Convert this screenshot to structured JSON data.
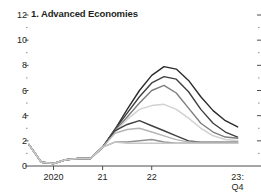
{
  "chart_data": {
    "type": "line",
    "title": "1. Advanced Economies",
    "xlabel": "",
    "ylabel": "",
    "ylim": [
      0,
      12
    ],
    "yticks": [
      0,
      2,
      4,
      6,
      8,
      10,
      12
    ],
    "ytick_labels": [
      "0",
      "2",
      "4",
      "6",
      "8",
      "10",
      "12"
    ],
    "minor_yticks": [
      1,
      3,
      5,
      7,
      9,
      11
    ],
    "grid": false,
    "legend": "none",
    "xtick_labels": [
      "2020",
      "21",
      "22",
      "23:\nQ4"
    ],
    "xticks": [
      2020.0,
      2021.0,
      2022.0,
      2023.75
    ],
    "xlim": [
      2019.5,
      2023.9
    ],
    "x": [
      2019.5,
      2019.75,
      2020.0,
      2020.25,
      2020.5,
      2020.75,
      2021.0,
      2021.25,
      2021.5,
      2021.75,
      2022.0,
      2022.25,
      2022.5,
      2022.75,
      2023.0,
      2023.25,
      2023.5,
      2023.75
    ],
    "series": [
      {
        "name": "series-1-darkest",
        "color": "#2b2b2b",
        "width": 1.4,
        "values": [
          1.7,
          0.3,
          0.2,
          0.5,
          0.6,
          0.6,
          1.5,
          2.9,
          4.5,
          6.0,
          7.2,
          7.9,
          7.7,
          6.8,
          5.5,
          4.4,
          3.6,
          3.1
        ]
      },
      {
        "name": "series-2-dark",
        "color": "#3f3f3f",
        "width": 1.4,
        "values": [
          1.7,
          0.3,
          0.2,
          0.5,
          0.6,
          0.6,
          1.5,
          2.9,
          4.2,
          5.5,
          6.6,
          7.1,
          6.9,
          5.9,
          4.5,
          3.4,
          2.7,
          2.3
        ]
      },
      {
        "name": "series-3-medium-gray",
        "color": "#7d7d7d",
        "width": 1.4,
        "values": [
          1.7,
          0.3,
          0.2,
          0.5,
          0.6,
          0.6,
          1.5,
          2.8,
          3.9,
          5.0,
          6.0,
          6.4,
          5.8,
          4.6,
          3.4,
          2.7,
          2.3,
          2.2
        ]
      },
      {
        "name": "series-4-light-gray",
        "color": "#d2d2d2",
        "width": 1.5,
        "values": [
          1.7,
          0.3,
          0.2,
          0.5,
          0.6,
          0.6,
          1.5,
          2.7,
          3.7,
          4.5,
          4.8,
          4.9,
          4.5,
          3.8,
          3.0,
          2.4,
          2.1,
          2.0
        ]
      },
      {
        "name": "series-5-dark-lower",
        "color": "#3f3f3f",
        "width": 1.4,
        "values": [
          1.7,
          0.3,
          0.2,
          0.5,
          0.6,
          0.6,
          1.5,
          2.8,
          3.3,
          3.6,
          3.2,
          2.8,
          2.4,
          2.0,
          1.9,
          1.9,
          1.9,
          1.9
        ]
      },
      {
        "name": "series-6-mid-light",
        "color": "#b5b5b5",
        "width": 1.4,
        "values": [
          1.7,
          0.3,
          0.2,
          0.5,
          0.6,
          0.6,
          1.5,
          2.6,
          2.9,
          3.0,
          2.7,
          2.4,
          2.1,
          1.9,
          1.9,
          1.9,
          1.9,
          1.9
        ]
      },
      {
        "name": "series-7-flat-gray",
        "color": "#909090",
        "width": 1.5,
        "values": [
          1.7,
          0.3,
          0.2,
          0.5,
          0.6,
          0.6,
          1.5,
          1.9,
          1.9,
          2.0,
          2.1,
          1.9,
          1.8,
          1.8,
          1.8,
          1.8,
          1.8,
          1.8
        ]
      },
      {
        "name": "series-8-flat-light",
        "color": "#c8c8c8",
        "width": 1.5,
        "values": [
          1.7,
          0.3,
          0.2,
          0.5,
          0.6,
          0.6,
          1.5,
          1.9,
          1.8,
          1.8,
          1.8,
          1.8,
          1.8,
          1.8,
          1.8,
          1.8,
          1.8,
          1.8
        ]
      }
    ],
    "axis_color": "#4d4d4d",
    "text_color": "#231f20",
    "background": "#ffffff"
  }
}
